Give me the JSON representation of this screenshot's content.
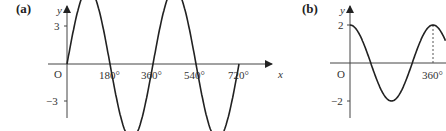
{
  "chart_data": [
    {
      "type": "line",
      "panel_label": "(a)",
      "title": "",
      "function": "y = 3 sin x",
      "xlabel": "x",
      "ylabel": "y",
      "origin_label": "O",
      "x_ticks": [
        "180°",
        "360°",
        "540°",
        "720°"
      ],
      "y_ticks": [
        "3",
        "−3"
      ],
      "xlim": [
        0,
        720
      ],
      "ylim": [
        -3,
        3
      ],
      "amplitude": 3,
      "period_deg": 360,
      "series": [
        {
          "name": "y = 3 sin x",
          "x": [
            0,
            90,
            180,
            270,
            360,
            450,
            540,
            630,
            720
          ],
          "y": [
            0,
            3,
            0,
            -3,
            0,
            3,
            0,
            -3,
            0
          ]
        }
      ],
      "grid": false
    },
    {
      "type": "line",
      "panel_label": "(b)",
      "title": "",
      "function": "y = 2 cos x",
      "xlabel": "",
      "ylabel": "y",
      "origin_label": "O",
      "x_ticks": [
        "360°"
      ],
      "y_ticks": [
        "2",
        "−2"
      ],
      "xlim": [
        0,
        360
      ],
      "ylim": [
        -2,
        2
      ],
      "amplitude": 2,
      "period_deg": 360,
      "series": [
        {
          "name": "y = 2 cos x",
          "x": [
            0,
            90,
            180,
            270,
            360
          ],
          "y": [
            2,
            0,
            -2,
            0,
            2
          ]
        }
      ],
      "annotations": [
        "dashed vertical line from 360° up to maximum"
      ],
      "grid": false
    }
  ]
}
